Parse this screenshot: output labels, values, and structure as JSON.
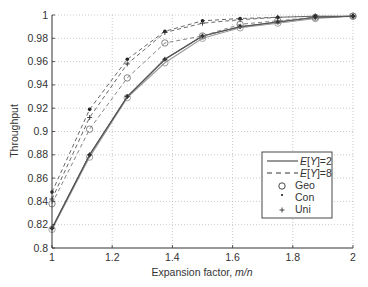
{
  "chart_data": {
    "type": "line",
    "title": "",
    "xlabel": "Expansion factor, m/n",
    "xlabel_plain": "Expansion factor, ",
    "xlabel_italic": "m/n",
    "ylabel": "Throughput",
    "xlim": [
      1,
      2
    ],
    "ylim": [
      0.8,
      1
    ],
    "grid": true,
    "legend_position": "lower right",
    "x_ticks": [
      "1",
      "1.2",
      "1.4",
      "1.6",
      "1.8",
      "2"
    ],
    "y_ticks": [
      "0.8",
      "0.82",
      "0.84",
      "0.86",
      "0.88",
      "0.9",
      "0.92",
      "0.94",
      "0.96",
      "0.98",
      "1"
    ],
    "x": [
      1,
      1.125,
      1.25,
      1.375,
      1.5,
      1.625,
      1.75,
      1.875,
      2
    ],
    "series": [
      {
        "name": "E[Y]=2 Geo",
        "line": "solid",
        "marker": "circle",
        "color": "#999999",
        "values": [
          0.816,
          0.878,
          0.929,
          0.959,
          0.98,
          0.989,
          0.993,
          0.997,
          0.999
        ]
      },
      {
        "name": "E[Y]=2 Con",
        "line": "solid",
        "marker": "dot",
        "color": "#555555",
        "values": [
          0.817,
          0.88,
          0.93,
          0.962,
          0.982,
          0.99,
          0.994,
          0.998,
          0.999
        ]
      },
      {
        "name": "E[Y]=2 Uni",
        "line": "solid",
        "marker": "plus",
        "color": "#555555",
        "values": [
          0.817,
          0.88,
          0.93,
          0.962,
          0.982,
          0.99,
          0.994,
          0.998,
          0.999
        ]
      },
      {
        "name": "E[Y]=8 Geo",
        "line": "dashed",
        "marker": "circle",
        "color": "#777777",
        "values": [
          0.838,
          0.902,
          0.946,
          0.976,
          0.982,
          0.992,
          0.995,
          0.998,
          0.999
        ]
      },
      {
        "name": "E[Y]=8 Con",
        "line": "dashed",
        "marker": "dot",
        "color": "#555555",
        "values": [
          0.848,
          0.919,
          0.962,
          0.986,
          0.995,
          0.997,
          0.998,
          0.999,
          0.999
        ]
      },
      {
        "name": "E[Y]=8 Uni",
        "line": "dashed",
        "marker": "plus",
        "color": "#555555",
        "values": [
          0.842,
          0.912,
          0.958,
          0.985,
          0.993,
          0.996,
          0.998,
          0.999,
          0.999
        ]
      }
    ],
    "legend": [
      {
        "label": "E[Y]=2",
        "prefix_italic": "E",
        "rest": "[Y]=2",
        "type": "line-solid"
      },
      {
        "label": "E[Y]=8",
        "prefix_italic": "E",
        "rest": "[Y]=8",
        "type": "line-dashed"
      },
      {
        "label": "Geo",
        "type": "marker-circle"
      },
      {
        "label": "Con",
        "type": "marker-dot"
      },
      {
        "label": "Uni",
        "type": "marker-plus"
      }
    ]
  },
  "layout": {
    "plot": {
      "left": 52,
      "right": 353,
      "top": 15,
      "bottom": 248
    },
    "legend_box": {
      "x": 262,
      "y": 152,
      "w": 70,
      "h": 66
    }
  }
}
